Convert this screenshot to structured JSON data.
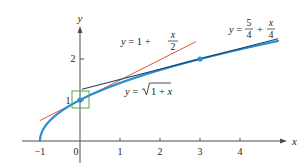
{
  "chart_data": {
    "type": "line",
    "title": "",
    "xlabel": "x",
    "ylabel": "y",
    "xlim": [
      -1.1,
      5.1
    ],
    "ylim": [
      0,
      2.8
    ],
    "grid": false,
    "x_ticks": [
      -1,
      0,
      1,
      2,
      3,
      4
    ],
    "x_tick_labels": [
      "−1",
      "0",
      "1",
      "2",
      "3",
      "4"
    ],
    "y_ticks": [
      1,
      2
    ],
    "y_tick_labels": [
      "1",
      "2"
    ],
    "series": [
      {
        "name": "y = √(1 + x)",
        "kind": "curve",
        "function": "sqrt(1+x)",
        "domain": [
          -1,
          4.95
        ],
        "color": "#2a8fd0"
      },
      {
        "name": "y = 1 + x/2",
        "kind": "tangent line at x=0",
        "function": "1 + x/2",
        "domain": [
          -1,
          2.9
        ],
        "color": "#e2553a"
      },
      {
        "name": "y = 5/4 + x/4",
        "kind": "tangent line at x=3",
        "function": "5/4 + x/4",
        "domain": [
          0.05,
          4.95
        ],
        "color": "#1f3f66"
      }
    ],
    "points": [
      {
        "x": 0,
        "y": 1,
        "color": "#2a8fd0"
      },
      {
        "x": 3,
        "y": 2,
        "color": "#2a8fd0"
      }
    ],
    "annotations": [
      {
        "type": "box",
        "center": [
          0,
          1
        ],
        "color": "#5aa83c",
        "note": "magnification window around (0,1)"
      }
    ],
    "labels": {
      "curve": {
        "lhs": "y = ",
        "radical": "1 + x"
      },
      "line1": {
        "lhs": "y = 1 + ",
        "num": "x",
        "den": "2"
      },
      "line2": {
        "lhs": "y = ",
        "num1": "5",
        "den1": "4",
        "plus": "+",
        "num2": "x",
        "den2": "4"
      }
    },
    "colors": {
      "axis": "#4d4d4f",
      "curve": "#2a8fd0",
      "tangent0": "#e2553a",
      "tangent3": "#1f3f66",
      "box": "#5aa83c",
      "text": "#231f20"
    }
  }
}
